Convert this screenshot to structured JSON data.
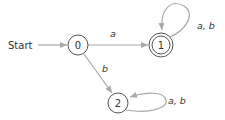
{
  "diagram": {
    "type": "finite-automaton",
    "start_label": "Start",
    "states": [
      {
        "id": "0",
        "label": "0",
        "accepting": false,
        "start": true
      },
      {
        "id": "1",
        "label": "1",
        "accepting": true,
        "start": false
      },
      {
        "id": "2",
        "label": "2",
        "accepting": false,
        "start": false
      }
    ],
    "transitions": [
      {
        "from": "0",
        "to": "1",
        "label": "a"
      },
      {
        "from": "0",
        "to": "2",
        "label": "b"
      },
      {
        "from": "1",
        "to": "1",
        "label": "a, b"
      },
      {
        "from": "2",
        "to": "2",
        "label": "a, b"
      }
    ],
    "colors": {
      "edge": "#a8a8a8",
      "node_stroke": "#555555",
      "text": "#333333"
    }
  }
}
